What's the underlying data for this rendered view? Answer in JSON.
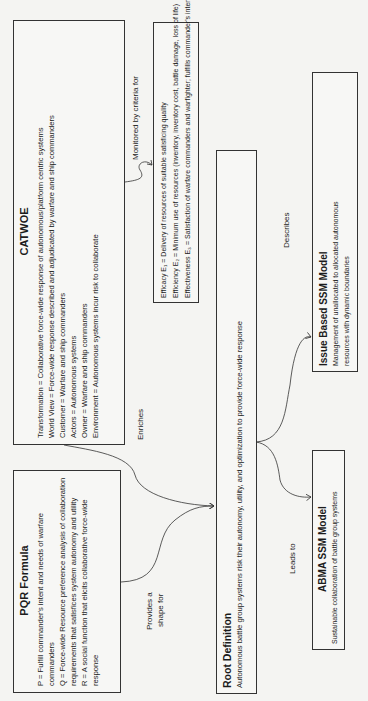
{
  "catwoe": {
    "title": "CATWOE",
    "lines": [
      "Transformation = Collaborative force-wide response of autonomous/platform centric systems",
      "World View = Force-wide response described and adjudicated by warfare and ship commanders",
      "Customer = Warfare and ship commanders",
      "Actors = Autonomous systems",
      "Owner = Warfare and ship commanders",
      "Environment = Autonomous systems incur risk to collaborate"
    ]
  },
  "criteria": {
    "lines": [
      "Efficacy E₁ = Delivery of resources of suitable satisficing quality",
      "Efficiency E₂ = Minimum use of resources (inventory, inventory cost, battle damage, loss of life)",
      "Effectiveness E₃ = Satisfaction of warfare commanders and warfighter; fulfills commander's intent"
    ]
  },
  "pqr": {
    "title": "PQR Formula",
    "lines": [
      "P = Fulfill commander's intent and needs of warfare commanders",
      "Q = Force-wide Resource preference analysis of collaboration requirements that satisfices system autonomy and utility",
      "R = A social function that elicits collaborative force-wide response"
    ]
  },
  "root": {
    "title": "Root Definition",
    "text": "Autonomous battle group systems risk their autonomy, utility, and optimization to provide force-wide response"
  },
  "issue": {
    "title": "Issue Based SSM Model",
    "text": "Management of unallocated to allocated autonomous resources with dynamic boundaries"
  },
  "abma": {
    "title": "ABMA SSM Model",
    "text": "Sustainable collaboration of battle group systems"
  },
  "edges": {
    "monitored": "Monitored by criteria for",
    "enriches": "Enriches",
    "provides_1": "Provides a",
    "provides_2": "shape for",
    "describes": "Describes",
    "leads": "Leads to"
  },
  "colors": {
    "line": "#333333",
    "background": "#f4f4f2"
  }
}
